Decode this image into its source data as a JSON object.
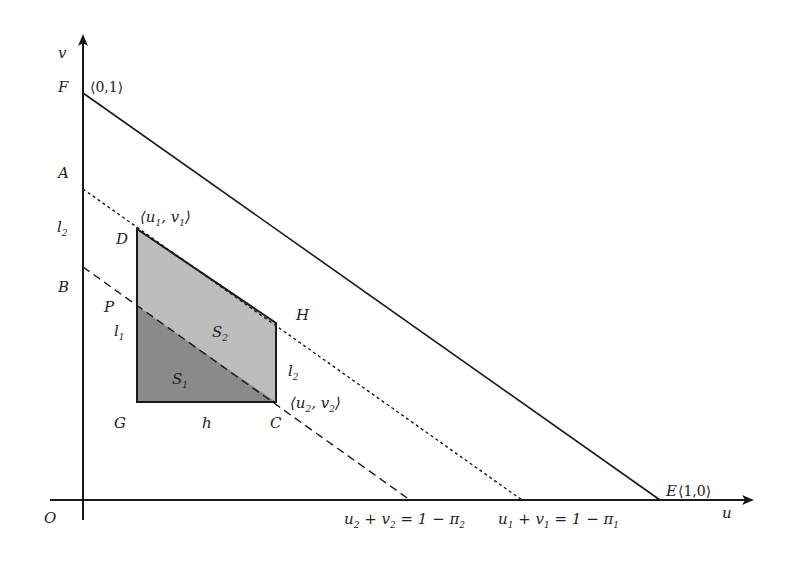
{
  "diagram": {
    "type": "geometric-region-diagram",
    "axes": {
      "x_label": "u",
      "y_label": "v",
      "origin_label": "O"
    },
    "points": {
      "F": {
        "label": "F",
        "coord_label": "⟨0,1⟩"
      },
      "A": {
        "label": "A"
      },
      "B": {
        "label": "B"
      },
      "D": {
        "label": "D",
        "coord_label_main": "⟨u",
        "coord_sub1": "1",
        "coord_mid": ", v",
        "coord_sub2": "1",
        "coord_end": "⟩"
      },
      "P": {
        "label": "P"
      },
      "H": {
        "label": "H"
      },
      "G": {
        "label": "G"
      },
      "C": {
        "label": "C",
        "coord_label_main": "⟨u",
        "coord_sub1": "2",
        "coord_mid": ", v",
        "coord_sub2": "2",
        "coord_end": "⟩"
      },
      "E": {
        "label": "E",
        "coord_label": "⟨1,0⟩"
      }
    },
    "segment_labels": {
      "l2_left": {
        "main": "l",
        "sub": "2"
      },
      "l1_left": {
        "main": "l",
        "sub": "1"
      },
      "l2_right": {
        "main": "l",
        "sub": "2"
      },
      "h_bottom": {
        "main": "h"
      }
    },
    "regions": {
      "S1": {
        "main": "S",
        "sub": "1",
        "fill": "#8a8a8a"
      },
      "S2": {
        "main": "S",
        "sub": "2",
        "fill": "#bdbdbd"
      }
    },
    "lines": {
      "solid": {
        "style": "solid",
        "from": "F",
        "to": "E",
        "equation": "u + v = 1"
      },
      "dotted": {
        "style": "dotted",
        "from": "A",
        "to": "u-axis",
        "eq_parts": [
          "u",
          "1",
          " + v",
          "1",
          " = 1 − π",
          "1"
        ]
      },
      "dashed": {
        "style": "dashed",
        "from": "B",
        "to": "u-axis",
        "eq_parts": [
          "u",
          "2",
          " + v",
          "2",
          " = 1 − π",
          "2"
        ]
      }
    },
    "colors": {
      "ink": "#1a1a1a",
      "dark_region": "#8a8a8a",
      "light_region": "#bdbdbd",
      "background": "#ffffff"
    }
  }
}
